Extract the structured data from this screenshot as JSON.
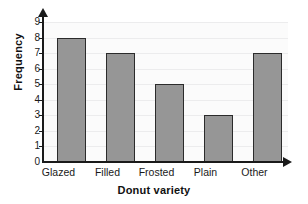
{
  "chart_data": {
    "type": "bar",
    "title": "",
    "xlabel": "Donut variety",
    "ylabel": "Frequency",
    "categories": [
      "Glazed",
      "Filled",
      "Frosted",
      "Plain",
      "Other"
    ],
    "values": [
      8,
      7,
      5,
      3,
      7
    ],
    "ylim": [
      0,
      9
    ],
    "ytick_labels": [
      "0",
      "1",
      "2",
      "3",
      "4",
      "5",
      "6",
      "7",
      "8",
      "9"
    ],
    "grid": true,
    "legend": "none",
    "bar_color": "#969696",
    "bar_edge_color": "#2b2b2b",
    "axis_color": "#1a1a1a",
    "plot_background": "#fbfbfb",
    "gridline_color": "#ececed"
  }
}
